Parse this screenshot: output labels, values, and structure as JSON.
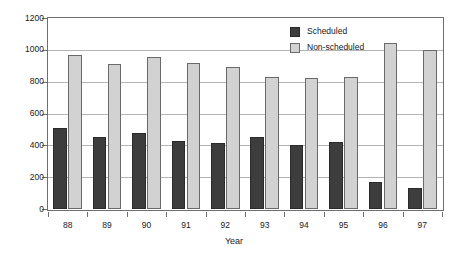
{
  "chart_data": {
    "type": "bar",
    "title": "",
    "subtitle": "",
    "xlabel": "Year",
    "ylabel": "",
    "categories": [
      "88",
      "89",
      "90",
      "91",
      "92",
      "93",
      "94",
      "95",
      "96",
      "97"
    ],
    "series": [
      {
        "name": "Scheduled",
        "color": "#3d3d3d",
        "values": [
          510,
          455,
          475,
          425,
          415,
          450,
          405,
          420,
          170,
          130
        ]
      },
      {
        "name": "Non-scheduled",
        "color": "#d2d2d2",
        "values": [
          970,
          910,
          955,
          920,
          890,
          830,
          820,
          830,
          1040,
          1000
        ]
      }
    ],
    "ylim": [
      0,
      1200
    ],
    "yticks": [
      0,
      200,
      400,
      600,
      800,
      1000,
      1200
    ],
    "ytick_labels": [
      "0",
      "200",
      "400",
      "600",
      "800",
      "1000",
      "1200"
    ],
    "grid": true,
    "grid_axis": "y",
    "legend_position": "top-right",
    "frame": true
  },
  "legend": {
    "items": [
      {
        "label": "Scheduled"
      },
      {
        "label": "Non-scheduled"
      }
    ]
  },
  "axes": {
    "x_title": "Year"
  },
  "colors": {
    "scheduled": "#3d3d3d",
    "non_scheduled": "#d2d2d2",
    "frame": "#6e6e6e",
    "grid": "#b4b4b4",
    "background": "#ffffff",
    "text": "#1a1a1a"
  }
}
